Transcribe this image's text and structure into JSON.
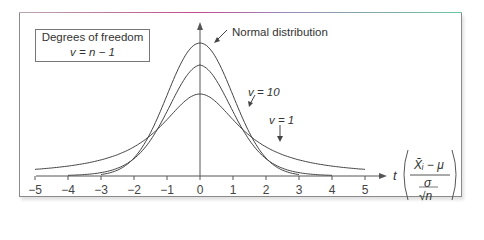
{
  "legend": {
    "title": "Degrees of freedom",
    "formula": "v = n − 1"
  },
  "annotations": {
    "normal": "Normal distribution",
    "v10": "v = 10",
    "v1": "v = 1"
  },
  "axis": {
    "x_label": "t",
    "formula_numerator": "X̄ᵢ − μ",
    "formula_denominator_top": "σ",
    "formula_denominator_bottom": "√n",
    "ticks": [
      "−5",
      "−4",
      "−3",
      "−2",
      "−1",
      "0",
      "1",
      "2",
      "3",
      "4",
      "5"
    ]
  },
  "chart_data": {
    "type": "line",
    "title": "",
    "xlabel": "t",
    "ylabel": "",
    "xlim": [
      -5,
      5
    ],
    "series": [
      {
        "name": "Normal distribution",
        "x_range": [
          -3,
          3
        ],
        "peak": 0.399
      },
      {
        "name": "v = 10",
        "x_range": [
          -4,
          4
        ],
        "peak": 0.389
      },
      {
        "name": "v = 1",
        "x_range": [
          -5,
          5
        ],
        "peak": 0.318
      }
    ],
    "legend": [
      "Degrees of freedom v = n − 1"
    ],
    "grid": false
  }
}
